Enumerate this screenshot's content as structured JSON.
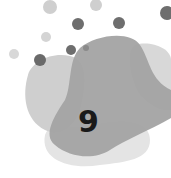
{
  "badge": {
    "number": "9"
  },
  "colors": {
    "dot_light": "#cfcfcf",
    "dot_dark": "#6e6e6e",
    "blob_light": "#d2d2d2",
    "blob_mid": "#a5a5a5",
    "blob_pale": "#e6e6e6",
    "text": "#1a1a1a"
  }
}
